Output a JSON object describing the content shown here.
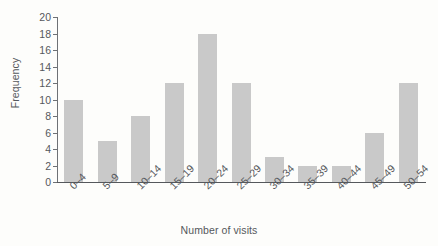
{
  "chart_data": {
    "type": "bar",
    "title": "",
    "subtitle": "",
    "xlabel": "Number of visits",
    "ylabel": "Frequency",
    "categories": [
      "0–4",
      "5–9",
      "10–14",
      "15–19",
      "20–24",
      "25–29",
      "30–34",
      "35–39",
      "40–44",
      "45–49",
      "50–54"
    ],
    "values": [
      10,
      5,
      8,
      12,
      18,
      12,
      3,
      2,
      2,
      6,
      12
    ],
    "ylim": [
      0,
      20
    ],
    "ytick_step": 2,
    "yticks": [
      0,
      2,
      4,
      6,
      8,
      10,
      12,
      14,
      16,
      18,
      20
    ],
    "ytick_labels": [
      "0",
      "2",
      "4",
      "6",
      "8",
      "10",
      "12",
      "14",
      "16",
      "18",
      "20"
    ],
    "grid": false,
    "legend": false,
    "legend_position": "none",
    "xtick_rotation": -45,
    "bar_color": "#c9c9c9",
    "axis_color": "#55585c",
    "text_color": "#55585c",
    "background_color": "#fdfdfb"
  }
}
